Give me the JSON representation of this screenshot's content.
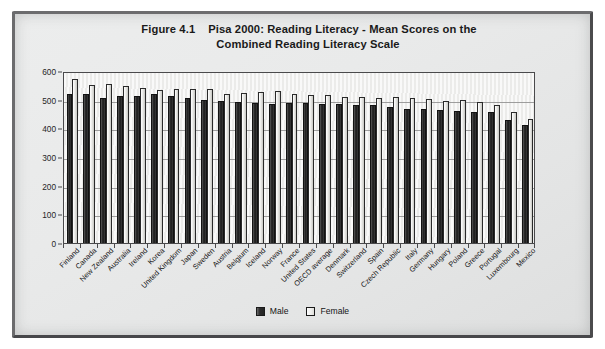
{
  "figure": {
    "number": "Figure 4.1",
    "title_line_1": "Pisa 2000: Reading Literacy - Mean Scores on the",
    "title_line_2": "Combined Reading Literacy Scale"
  },
  "legend": {
    "position": "bottom-center",
    "items": [
      {
        "label": "Male",
        "color": "#2b2b2b",
        "key": "male"
      },
      {
        "label": "Female",
        "color": "#e6e6e2",
        "key": "female"
      }
    ]
  },
  "axis": {
    "y_ticks": [
      "0",
      "100",
      "200",
      "300",
      "400",
      "500",
      "600"
    ]
  },
  "chart_data": {
    "type": "bar",
    "xlabel": "",
    "ylabel": "",
    "ylim": [
      0,
      600
    ],
    "ytick_step": 100,
    "grid": true,
    "legend_position": "bottom-center",
    "categories": [
      "Finland",
      "Canada",
      "New Zealand",
      "Australia",
      "Ireland",
      "Korea",
      "United Kingdom",
      "Japan",
      "Sweden",
      "Austria",
      "Belgium",
      "Iceland",
      "Norway",
      "France",
      "United States",
      "OECD average",
      "Denmark",
      "Switzerland",
      "Spain",
      "Czech Republic",
      "Italy",
      "Germany",
      "Hungary",
      "Poland",
      "Greece",
      "Portugal",
      "Luxembourg",
      "Mexico"
    ],
    "series": [
      {
        "name": "Male",
        "color": "#2b2b2b",
        "values": [
          520,
          519,
          507,
          513,
          513,
          519,
          512,
          507,
          499,
          495,
          492,
          488,
          486,
          490,
          490,
          485,
          485,
          480,
          481,
          473,
          469,
          468,
          465,
          461,
          456,
          458,
          429,
          411
        ]
      },
      {
        "name": "Female",
        "color": "#e6e6e2",
        "values": [
          571,
          551,
          553,
          546,
          542,
          533,
          537,
          537,
          536,
          520,
          525,
          528,
          529,
          519,
          518,
          517,
          510,
          510,
          505,
          510,
          507,
          502,
          496,
          498,
          493,
          482,
          456,
          432
        ]
      }
    ]
  }
}
